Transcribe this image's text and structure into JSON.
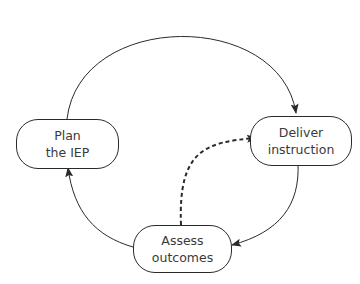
{
  "diagram": {
    "nodes": [
      {
        "id": "plan",
        "line1": "Plan",
        "line2": "the IEP"
      },
      {
        "id": "deliver",
        "line1": "Deliver",
        "line2": "instruction"
      },
      {
        "id": "assess",
        "line1": "Assess",
        "line2": "outcomes"
      }
    ],
    "edges": [
      {
        "from": "plan",
        "to": "deliver",
        "style": "solid",
        "shape": "arc"
      },
      {
        "from": "deliver",
        "to": "assess",
        "style": "solid",
        "shape": "arc"
      },
      {
        "from": "assess",
        "to": "plan",
        "style": "solid",
        "shape": "arc"
      },
      {
        "from": "assess",
        "to": "deliver",
        "style": "dashed",
        "shape": "curve"
      }
    ],
    "colors": {
      "stroke": "#2a2a2a",
      "text": "#3a3a3a",
      "background": "#ffffff"
    }
  }
}
